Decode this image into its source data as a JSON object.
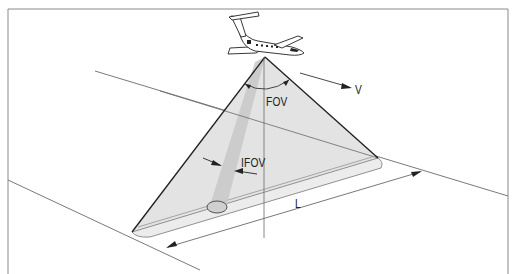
{
  "diagram": {
    "type": "airborne-scanner-geometry",
    "labels": {
      "fov": "FOV",
      "ifov": "IFOV",
      "velocity": "V",
      "swath_length": "L"
    },
    "elements": {
      "aircraft": "jet-aircraft",
      "scan_triangle": "field-of-view-cone",
      "ground_swath": "swath-band",
      "ifov_footprint": "ellipse-footprint"
    },
    "colors": {
      "frame": "#8a8a8a",
      "line": "#666666",
      "triangle_fill": "#e2e2e2",
      "ifov_beam": "#c6c6c6",
      "swath_fill": "#ebebeb",
      "dark_edge": "#1e1e1e"
    }
  }
}
